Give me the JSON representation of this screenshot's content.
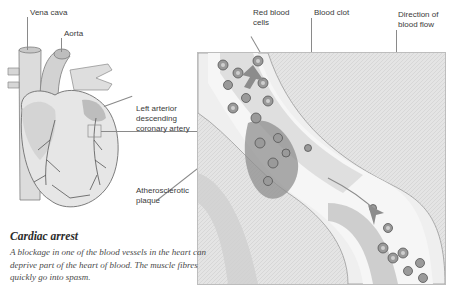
{
  "labels": {
    "vena_cava": "Vena cava",
    "aorta": "Aorta",
    "lad": [
      "Left arterior",
      "descending",
      "coronary artery"
    ],
    "plaque": [
      "Atherosclerotic",
      "plaque"
    ],
    "rbc": [
      "Red blood",
      "cells"
    ],
    "clot": "Blood clot",
    "flow": [
      "Direction of",
      "blood flow"
    ]
  },
  "caption": {
    "title": "Cardiac arrest",
    "body": "A blockage in one of the blood vessels in the heart can deprive part of the heart of blood. The muscle fibres quickly go into spasm."
  },
  "colors": {
    "line": "#8a8a8a",
    "vessel": "#d8d8d8",
    "vessel_dark": "#9a9a9a",
    "cell": "#7a7a7a",
    "arrow": "#8c8c8c"
  }
}
